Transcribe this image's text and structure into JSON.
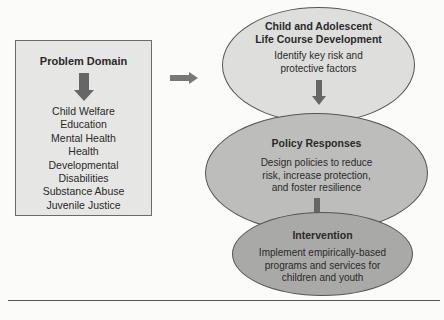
{
  "problem_domain": {
    "title": "Problem Domain",
    "items": [
      "Child Welfare",
      "Education",
      "Mental Health",
      "Health",
      "Developmental",
      "Disabilities",
      "Substance Abuse",
      "Juvenile Justice"
    ]
  },
  "stages": [
    {
      "title_lines": [
        "Child and Adolescent",
        "Life Course Development"
      ],
      "text_lines": [
        "Identify key risk and",
        "protective factors"
      ]
    },
    {
      "title_lines": [
        "Policy Responses"
      ],
      "text_lines": [
        "Design policies to reduce",
        "risk, increase protection,",
        "and foster resilience"
      ]
    },
    {
      "title_lines": [
        "Intervention"
      ],
      "text_lines": [
        "Implement empirically-based",
        "programs and services for",
        "children and youth"
      ]
    }
  ],
  "colors": {
    "box_fill": "#e6e6e4",
    "ellipse_1": "#dededc",
    "ellipse_2": "#bdbdbb",
    "ellipse_3": "#a9a9a7",
    "arrow": "#666666"
  }
}
